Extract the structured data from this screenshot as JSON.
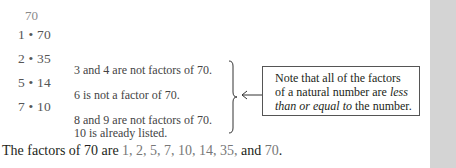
{
  "number": "70",
  "factor_pairs": [
    {
      "label": "1 • 70"
    },
    {
      "label": "2 • 35"
    },
    {
      "label": "5 • 14"
    },
    {
      "label": "7 • 10"
    }
  ],
  "annotations": [
    "3 and 4 are not factors of 70.",
    "6 is not a factor of 70.",
    "8 and 9 are not factors of 70.",
    "10 is already listed."
  ],
  "callout": {
    "line1": "Note that all of the factors",
    "line2_prefix": "of a natural number are ",
    "line2_italic": "less",
    "line3_italic": "than or equal to",
    "line3_suffix": " the number."
  },
  "summary": {
    "prefix": "The factors of 70 are ",
    "factors_list": "1, 2, 5, 7, 10, 14, 35,",
    "conjunction": " and ",
    "last_factor": "70",
    "end": "."
  }
}
